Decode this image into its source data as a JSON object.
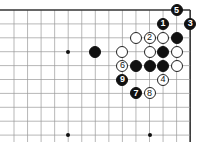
{
  "board": {
    "origin_x": 14,
    "origin_y": 10,
    "step_x": 13.55,
    "step_y": 13.9,
    "cols": 14,
    "rows": 10,
    "top_edge": true,
    "right_edge": true,
    "line_color": "#999999",
    "edge_color": "#333333"
  },
  "hoshi": [
    {
      "col": 4,
      "row": 3
    },
    {
      "col": 4,
      "row": 9
    },
    {
      "col": 10,
      "row": 9
    }
  ],
  "stones": [
    {
      "col": 12,
      "row": 0,
      "color": "black",
      "label": "5"
    },
    {
      "col": 11,
      "row": 1,
      "color": "black",
      "label": "1"
    },
    {
      "col": 13,
      "row": 1,
      "color": "black",
      "label": "3"
    },
    {
      "col": 9,
      "row": 2,
      "color": "white",
      "label": ""
    },
    {
      "col": 10,
      "row": 2,
      "color": "white",
      "label": "2"
    },
    {
      "col": 11,
      "row": 2,
      "color": "white",
      "label": ""
    },
    {
      "col": 12,
      "row": 2,
      "color": "black",
      "label": ""
    },
    {
      "col": 6,
      "row": 3,
      "color": "black",
      "label": ""
    },
    {
      "col": 8,
      "row": 3,
      "color": "white",
      "label": ""
    },
    {
      "col": 10,
      "row": 3,
      "color": "white",
      "label": ""
    },
    {
      "col": 11,
      "row": 3,
      "color": "black",
      "label": ""
    },
    {
      "col": 12,
      "row": 3,
      "color": "white",
      "label": ""
    },
    {
      "col": 8,
      "row": 4,
      "color": "white",
      "label": "6"
    },
    {
      "col": 9,
      "row": 4,
      "color": "black",
      "label": ""
    },
    {
      "col": 10,
      "row": 4,
      "color": "black",
      "label": ""
    },
    {
      "col": 11,
      "row": 4,
      "color": "black",
      "label": ""
    },
    {
      "col": 12,
      "row": 4,
      "color": "white",
      "label": ""
    },
    {
      "col": 8,
      "row": 5,
      "color": "black",
      "label": "9"
    },
    {
      "col": 11,
      "row": 5,
      "color": "white",
      "label": "4"
    },
    {
      "col": 9,
      "row": 6,
      "color": "black",
      "label": "7"
    },
    {
      "col": 10,
      "row": 6,
      "color": "white",
      "label": "8"
    }
  ]
}
